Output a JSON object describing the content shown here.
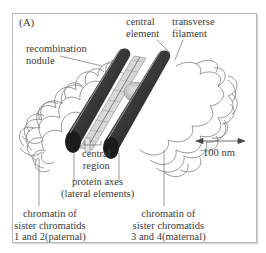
{
  "figure": {
    "panel_label": "(A)",
    "labels": {
      "recombination_nodule": [
        "recombination",
        "nodule"
      ],
      "central_element": [
        "central",
        "element"
      ],
      "transverse_filament": [
        "transverse",
        "filament"
      ],
      "central_region": [
        "central",
        "region"
      ],
      "protein_axes": [
        "protein axes",
        "(lateral elements)"
      ],
      "chromatin_paternal": [
        "chromatin of",
        "sister chromatids",
        "1 and 2(paternal)"
      ],
      "chromatin_maternal": [
        "chromatin of",
        "sister chromatids",
        "3 and 4(maternal)"
      ]
    },
    "scale_bar": {
      "label": "100 nm"
    },
    "colors": {
      "axis_dark": "#2e2e2e",
      "axis_highlight": "#8a8a8a",
      "chromatin_loops": "#6e6e6e",
      "nodule": "#c4c4c4",
      "central_region": "#d8d8d8",
      "frame": "#b9b9b9"
    }
  }
}
